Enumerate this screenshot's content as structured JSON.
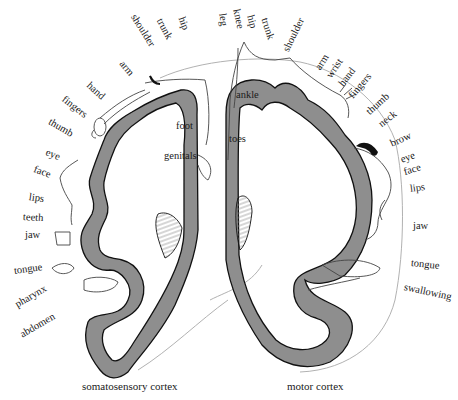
{
  "figure": {
    "colors": {
      "cortex_fill": "#8e8e8e",
      "cortex_outline": "#111111",
      "body_outline": "#444444",
      "head_outline": "#9a9a9a",
      "hatch": "#777777",
      "background": "#ffffff"
    }
  },
  "somatosensory": {
    "caption": "somatosensory cortex",
    "labels": [
      {
        "text": "hip",
        "x": 181,
        "y": 12,
        "rot": 70
      },
      {
        "text": "trunk",
        "x": 159,
        "y": 14,
        "rot": 62
      },
      {
        "text": "shoulder",
        "x": 133,
        "y": 10,
        "rot": 58
      },
      {
        "text": "arm",
        "x": 121,
        "y": 57,
        "rot": 50
      },
      {
        "text": "hand",
        "x": 88,
        "y": 79,
        "rot": 42
      },
      {
        "text": "fingers",
        "x": 63,
        "y": 93,
        "rot": 38
      },
      {
        "text": "thumb",
        "x": 49,
        "y": 116,
        "rot": 30
      },
      {
        "text": "eye",
        "x": 46,
        "y": 147,
        "rot": 22
      },
      {
        "text": "face",
        "x": 34,
        "y": 164,
        "rot": 20
      },
      {
        "text": "lips",
        "x": 29,
        "y": 192,
        "rot": 8
      },
      {
        "text": "teeth",
        "x": 23,
        "y": 212,
        "rot": 3
      },
      {
        "text": "jaw",
        "x": 25,
        "y": 230,
        "rot": 0
      },
      {
        "text": "tongue",
        "x": 14,
        "y": 266,
        "rot": -8
      },
      {
        "text": "pharynx",
        "x": 16,
        "y": 293,
        "rot": -30
      },
      {
        "text": "abdomen",
        "x": 21,
        "y": 323,
        "rot": -30
      },
      {
        "text": "foot",
        "x": 176,
        "y": 125,
        "rot": 0
      },
      {
        "text": "genitals",
        "x": 164,
        "y": 155,
        "rot": 0
      }
    ]
  },
  "motor": {
    "caption": "motor cortex",
    "labels": [
      {
        "text": "leg",
        "x": 220,
        "y": 10,
        "rot": 82
      },
      {
        "text": "knee",
        "x": 234,
        "y": 4,
        "rot": 78
      },
      {
        "text": "hip",
        "x": 248,
        "y": 10,
        "rot": 76
      },
      {
        "text": "trunk",
        "x": 262,
        "y": 14,
        "rot": 72
      },
      {
        "text": "shoulder",
        "x": 286,
        "y": 3,
        "rot": 64
      },
      {
        "text": "arm",
        "x": 319,
        "y": 52,
        "rot": -58
      },
      {
        "text": "wrist",
        "x": 330,
        "y": 65,
        "rot": -56
      },
      {
        "text": "hand",
        "x": 342,
        "y": 76,
        "rot": -52
      },
      {
        "text": "fingers",
        "x": 352,
        "y": 88,
        "rot": -50
      },
      {
        "text": "thumb",
        "x": 368,
        "y": 107,
        "rot": -42
      },
      {
        "text": "neck",
        "x": 379,
        "y": 120,
        "rot": -38
      },
      {
        "text": "brow",
        "x": 390,
        "y": 139,
        "rot": -24
      },
      {
        "text": "eye",
        "x": 400,
        "y": 155,
        "rot": -20
      },
      {
        "text": "face",
        "x": 404,
        "y": 167,
        "rot": -16
      },
      {
        "text": "lips",
        "x": 410,
        "y": 187,
        "rot": -8
      },
      {
        "text": "jaw",
        "x": 413,
        "y": 226,
        "rot": 0
      },
      {
        "text": "tongue",
        "x": 411,
        "y": 262,
        "rot": 6
      },
      {
        "text": "swallowing",
        "x": 405,
        "y": 286,
        "rot": 12
      },
      {
        "text": "ankle",
        "x": 236,
        "y": 94,
        "rot": 0
      },
      {
        "text": "toes",
        "x": 229,
        "y": 138,
        "rot": 0
      }
    ]
  }
}
